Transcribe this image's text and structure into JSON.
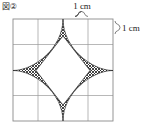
{
  "figure": {
    "label": "図②",
    "background_color": "#ffffff"
  },
  "grid": {
    "columns": 4,
    "rows": 4,
    "cell_size_cm": 1,
    "line_color": "#9a9a9a",
    "border_color": "#8a8a8a",
    "x0": 13,
    "y0": 19,
    "cell_px": 25
  },
  "dimensions": [
    {
      "id": "top-width",
      "label": "1 cm",
      "orientation": "horizontal",
      "spans_cells": 1,
      "brace_position": "above-top-right-cell"
    },
    {
      "id": "right-height",
      "label": "1 cm",
      "orientation": "vertical",
      "spans_cells": 1,
      "brace_position": "right-of-top-right-cell"
    }
  ],
  "shape": {
    "name": "astroid-star",
    "points": 4,
    "tip_directions": [
      "up",
      "right",
      "down",
      "left"
    ],
    "fill_pattern": "cross-hatch",
    "fill_color": "#2a2a2a",
    "outline_color": "#1a1a1a",
    "interior_color": "#ffffff",
    "center_x": 63,
    "center_y": 70.5,
    "radius_px": 51,
    "tip_up": {
      "x": 63,
      "y": 19
    },
    "tip_right": {
      "x": 113,
      "y": 70.5
    },
    "tip_down": {
      "x": 63,
      "y": 121
    },
    "tip_left": {
      "x": 13,
      "y": 70.5
    }
  },
  "colors": {
    "ink": "#1a1a1a",
    "grid_line": "#9a9a9a",
    "paper": "#ffffff"
  }
}
